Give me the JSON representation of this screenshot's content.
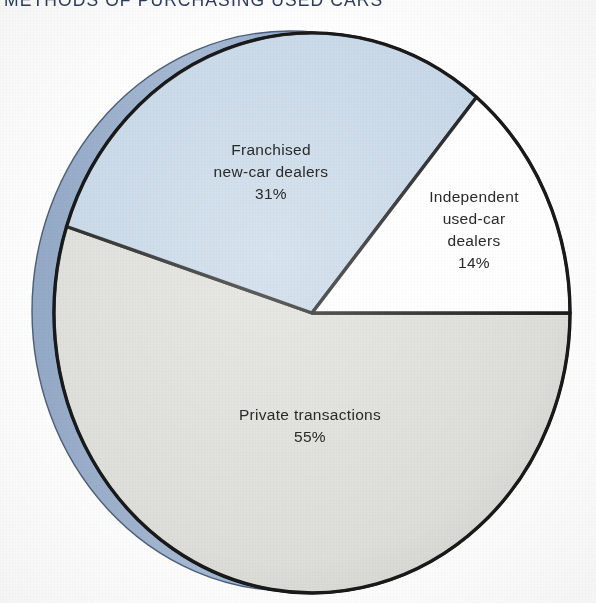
{
  "title": "METHODS OF PURCHASING USED CARS",
  "colors": {
    "title_text": "#2d3c5e",
    "slice_blue": "#c3d5e6",
    "slice_white": "#ffffff",
    "slice_gray": "#dcdcd8",
    "rim_blue": "#8fa6c4",
    "rim_shadow": "#6e86a8",
    "outline": "#111111",
    "label_text": "#2a2a2a",
    "page_background": "#fefefe"
  },
  "labels": {
    "franchised": {
      "line1": "Franchised",
      "line2": "new-car dealers",
      "pct": "31%"
    },
    "independent": {
      "line1": "Independent",
      "line2": "used-car",
      "line3": "dealers",
      "pct": "14%"
    },
    "private": {
      "line1": "Private transactions",
      "pct": "55%"
    }
  },
  "chart_data": {
    "type": "pie",
    "title": "METHODS OF PURCHASING USED CARS",
    "xlabel": "",
    "ylabel": "",
    "grid": false,
    "legend_position": "none",
    "labels_inside_slices": true,
    "three_d": true,
    "start_angle_deg": 0,
    "direction": "clockwise",
    "total_pct": 100,
    "categories": [
      "Independent used-car dealers",
      "Franchised new-car dealers",
      "Private transactions"
    ],
    "values": [
      14,
      31,
      55
    ],
    "slices": [
      {
        "name": "Independent used-car dealers",
        "value": 14,
        "value_label": "14%",
        "color": "#ffffff",
        "start_angle_deg": 0,
        "end_angle_deg": 50.4
      },
      {
        "name": "Franchised new-car dealers",
        "value": 31,
        "value_label": "31%",
        "color": "#c3d5e6",
        "start_angle_deg": 50.4,
        "end_angle_deg": 162.0
      },
      {
        "name": "Private transactions",
        "value": 55,
        "value_label": "55%",
        "color": "#dcdcd8",
        "start_angle_deg": 162.0,
        "end_angle_deg": 360.0
      }
    ]
  }
}
